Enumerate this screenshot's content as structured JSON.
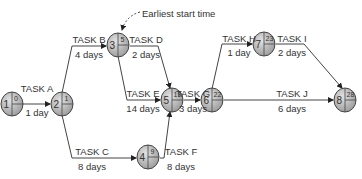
{
  "diagram": {
    "annotation": "Earliest start time",
    "colors": {
      "node_fill": "#b9b9b9",
      "node_stroke": "#444444",
      "line": "#444444",
      "text": "#333333"
    },
    "nodes": [
      {
        "id": "1",
        "earliest_start": "0"
      },
      {
        "id": "2",
        "earliest_start": "1"
      },
      {
        "id": "3",
        "earliest_start": "5"
      },
      {
        "id": "4",
        "earliest_start": "9"
      },
      {
        "id": "5",
        "earliest_start": "19"
      },
      {
        "id": "6",
        "earliest_start": "22"
      },
      {
        "id": "7",
        "earliest_start": "23"
      },
      {
        "id": "8",
        "earliest_start": "28"
      }
    ],
    "tasks": [
      {
        "name": "TASK A",
        "duration": "1 day",
        "from": "1",
        "to": "2"
      },
      {
        "name": "TASK B",
        "duration": "4 days",
        "from": "2",
        "to": "3"
      },
      {
        "name": "TASK C",
        "duration": "8 days",
        "from": "2",
        "to": "4"
      },
      {
        "name": "TASK D",
        "duration": "2 days",
        "from": "3",
        "to": "5"
      },
      {
        "name": "TASK E",
        "duration": "14 days",
        "from": "3",
        "to": "5"
      },
      {
        "name": "TASK F",
        "duration": "8 days",
        "from": "4",
        "to": "5"
      },
      {
        "name": "TASK G",
        "duration": "3 days",
        "from": "5",
        "to": "6"
      },
      {
        "name": "TASK H",
        "duration": "1 day",
        "from": "6",
        "to": "7"
      },
      {
        "name": "TASK I",
        "duration": "2 days",
        "from": "7",
        "to": "8"
      },
      {
        "name": "TASK J",
        "duration": "6 days",
        "from": "6",
        "to": "8"
      }
    ]
  }
}
